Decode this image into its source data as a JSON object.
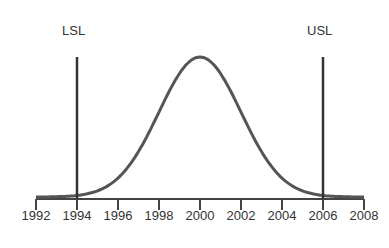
{
  "chart_data": {
    "type": "line",
    "title": "",
    "xlabel": "",
    "ylabel": "",
    "x_ticks": [
      "1992",
      "1994",
      "1996",
      "1998",
      "2000",
      "2002",
      "2004",
      "2006",
      "2008"
    ],
    "xlim": [
      1992,
      2008
    ],
    "grid": false,
    "legend": null,
    "series": [
      {
        "name": "Normal distribution curve",
        "distribution": "normal",
        "mean": 2000,
        "std_dev": 2,
        "x": [
          1994,
          1995,
          1996,
          1997,
          1998,
          1999,
          2000,
          2001,
          2002,
          2003,
          2004,
          2005,
          2006
        ],
        "relative_height": [
          0.011,
          0.044,
          0.135,
          0.325,
          0.607,
          0.882,
          1.0,
          0.882,
          0.607,
          0.325,
          0.135,
          0.044,
          0.011
        ]
      }
    ],
    "annotations": [
      {
        "label": "LSL",
        "type": "vertical_line",
        "x": 1994
      },
      {
        "label": "USL",
        "type": "vertical_line",
        "x": 2006
      }
    ]
  },
  "labels": {
    "lsl": "LSL",
    "usl": "USL"
  },
  "colors": {
    "curve": "#555555",
    "limit_lines": "#333333",
    "axis": "#444444"
  }
}
